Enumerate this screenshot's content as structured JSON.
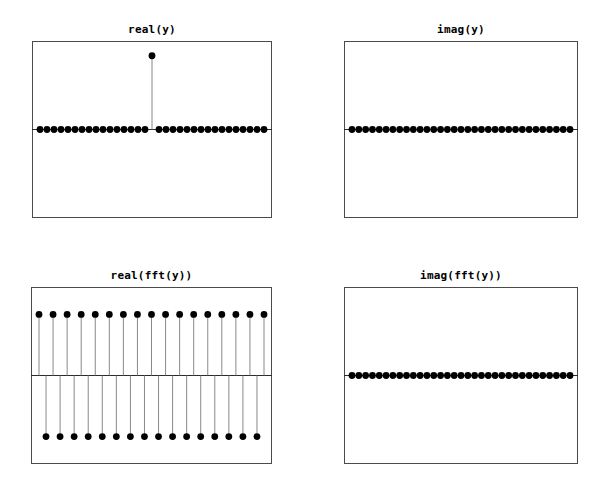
{
  "figure": {
    "width": 610,
    "height": 493,
    "background": "#ffffff",
    "marker_color": "#000000",
    "stem_color": "#7c7c7c",
    "axis_color": "#4a4a4a",
    "zero_line_color": "#2b2b2b"
  },
  "panels": [
    {
      "id": "real-y",
      "title": "real(y)",
      "frame": {
        "x": 32,
        "y": 41,
        "width": 240,
        "height": 177
      },
      "zero_y_frac": 0.5,
      "chart_ref": 0
    },
    {
      "id": "imag-y",
      "title": "imag(y)",
      "frame": {
        "x": 344,
        "y": 41,
        "width": 234,
        "height": 177
      },
      "zero_y_frac": 0.5,
      "chart_ref": 1
    },
    {
      "id": "real-fft-y",
      "title": "real(fft(y))",
      "frame": {
        "x": 31,
        "y": 287,
        "width": 241,
        "height": 177
      },
      "zero_y_frac": 0.5,
      "chart_ref": 2
    },
    {
      "id": "imag-fft-y",
      "title": "imag(fft(y))",
      "frame": {
        "x": 344,
        "y": 287,
        "width": 234,
        "height": 177
      },
      "zero_y_frac": 0.5,
      "chart_ref": 3
    }
  ],
  "chart_data": [
    {
      "type": "scatter",
      "plot_style": "stem",
      "title": "real(y)",
      "xlabel": "",
      "ylabel": "",
      "x": [
        0,
        1,
        2,
        3,
        4,
        5,
        6,
        7,
        8,
        9,
        10,
        11,
        12,
        13,
        14,
        15,
        16,
        17,
        18,
        19,
        20,
        21,
        22,
        23,
        24,
        25,
        26,
        27,
        28,
        29,
        30,
        31,
        32
      ],
      "values": [
        0,
        0,
        0,
        0,
        0,
        0,
        0,
        0,
        0,
        0,
        0,
        0,
        0,
        0,
        0,
        0,
        1,
        0,
        0,
        0,
        0,
        0,
        0,
        0,
        0,
        0,
        0,
        0,
        0,
        0,
        0,
        0,
        0
      ],
      "xlim": [
        0,
        32
      ],
      "ylim": [
        -1.2,
        1.2
      ],
      "grid": false,
      "legend": null,
      "annotation": "unit impulse at index 16"
    },
    {
      "type": "scatter",
      "plot_style": "stem",
      "title": "imag(y)",
      "xlabel": "",
      "ylabel": "",
      "x": [
        0,
        1,
        2,
        3,
        4,
        5,
        6,
        7,
        8,
        9,
        10,
        11,
        12,
        13,
        14,
        15,
        16,
        17,
        18,
        19,
        20,
        21,
        22,
        23,
        24,
        25,
        26,
        27,
        28,
        29,
        30,
        31,
        32
      ],
      "values": [
        0,
        0,
        0,
        0,
        0,
        0,
        0,
        0,
        0,
        0,
        0,
        0,
        0,
        0,
        0,
        0,
        0,
        0,
        0,
        0,
        0,
        0,
        0,
        0,
        0,
        0,
        0,
        0,
        0,
        0,
        0,
        0,
        0
      ],
      "xlim": [
        0,
        32
      ],
      "ylim": [
        -1.2,
        1.2
      ],
      "grid": false,
      "legend": null,
      "annotation": "all zeros"
    },
    {
      "type": "scatter",
      "plot_style": "stem",
      "title": "real(fft(y))",
      "xlabel": "",
      "ylabel": "",
      "x": [
        0,
        1,
        2,
        3,
        4,
        5,
        6,
        7,
        8,
        9,
        10,
        11,
        12,
        13,
        14,
        15,
        16,
        17,
        18,
        19,
        20,
        21,
        22,
        23,
        24,
        25,
        26,
        27,
        28,
        29,
        30,
        31,
        32
      ],
      "values": [
        1,
        -1,
        1,
        -1,
        1,
        -1,
        1,
        -1,
        1,
        -1,
        1,
        -1,
        1,
        -1,
        1,
        -1,
        1,
        -1,
        1,
        -1,
        1,
        -1,
        1,
        -1,
        1,
        -1,
        1,
        -1,
        1,
        -1,
        1,
        -1,
        1
      ],
      "xlim": [
        0,
        32
      ],
      "ylim": [
        -1.45,
        1.45
      ],
      "grid": false,
      "legend": null,
      "annotation": "alternating +1/-1 sequence"
    },
    {
      "type": "scatter",
      "plot_style": "stem",
      "title": "imag(fft(y))",
      "xlabel": "",
      "ylabel": "",
      "x": [
        0,
        1,
        2,
        3,
        4,
        5,
        6,
        7,
        8,
        9,
        10,
        11,
        12,
        13,
        14,
        15,
        16,
        17,
        18,
        19,
        20,
        21,
        22,
        23,
        24,
        25,
        26,
        27,
        28,
        29,
        30,
        31,
        32
      ],
      "values": [
        0,
        0,
        0,
        0,
        0,
        0,
        0,
        0,
        0,
        0,
        0,
        0,
        0,
        0,
        0,
        0,
        0,
        0,
        0,
        0,
        0,
        0,
        0,
        0,
        0,
        0,
        0,
        0,
        0,
        0,
        0,
        0,
        0
      ],
      "xlim": [
        0,
        32
      ],
      "ylim": [
        -1.2,
        1.2
      ],
      "grid": false,
      "legend": null,
      "annotation": "all zeros"
    }
  ]
}
